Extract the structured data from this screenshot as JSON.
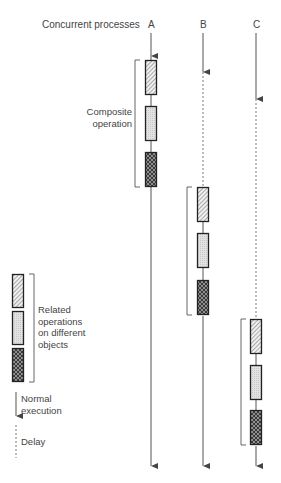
{
  "header": {
    "title": "Concurrent processes",
    "processes": [
      "A",
      "B",
      "C"
    ]
  },
  "annotations": {
    "composite_line1": "Composite",
    "composite_line2": "operation"
  },
  "legend": {
    "related_line1": "Related",
    "related_line2": "operations",
    "related_line3": "on different",
    "related_line4": "objects",
    "normal_line1": "Normal",
    "normal_line2": "execution",
    "delay": "Delay"
  },
  "operation_types": [
    "diagonal-hatch",
    "light-dotted",
    "dark-crosshatch"
  ],
  "colors": {
    "line": "#555555",
    "box_border": "#222222",
    "hatch_fill": "#e8e8e8",
    "light_fill": "#dddddd",
    "dark_fill": "#444444"
  }
}
